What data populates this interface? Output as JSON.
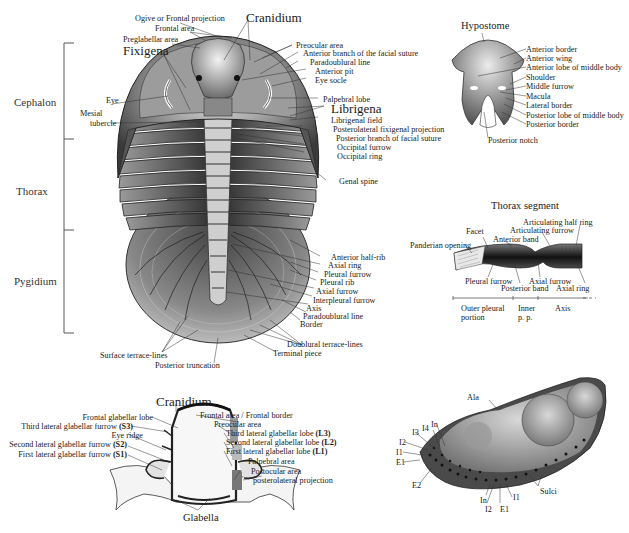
{
  "figure": {
    "main_trilobite": {
      "title": "Cranidium",
      "body_regions": [
        "Cephalon",
        "Thorax",
        "Pygidium"
      ],
      "left_labels": {
        "fixigena": "Fixigena",
        "eye": "Eye",
        "mesial_tubercle_1": "Mesial",
        "mesial_tubercle_2": "tubercle"
      },
      "top_labels": {
        "ogive": "Ogive or Frontal projection",
        "frontal_area": "Frontal area",
        "preglabellar_area": "Preglabellar area"
      },
      "right_labels": [
        "Preocular area",
        "Anterior branch of the facial suture",
        "Paradoublural line",
        "Anterior pit",
        "Eye socle",
        "Palpebral lobe",
        "Librigena",
        "Librigenal field",
        "Posterolateral fixigenal projection",
        "Posterior branch of facial suture",
        "Occipital furrow",
        "Occipital ring",
        "Genal spine"
      ],
      "pygidium_labels": [
        "Anterior half-rib",
        "Axial ring",
        "Pleural furrow",
        "Pleural rib",
        "Axial furrow",
        "Interpleural furrow",
        "Axis",
        "Paradoublural line",
        "Border",
        "Doublural terrace-lines",
        "Terminal piece"
      ],
      "bottom_labels": {
        "surface_terrace": "Surface terrace-lines",
        "posterior_truncation": "Posterior truncation"
      }
    },
    "hypostome": {
      "title": "Hypostome",
      "labels": [
        "Anterior border",
        "Anterior wing",
        "Anterior lobe of middle body",
        "Shoulder",
        "Middle furrow",
        "Macula",
        "Lateral border",
        "Posterior lobe of middle body",
        "Posterior border"
      ],
      "bottom_label": "Posterior notch"
    },
    "thorax_segment": {
      "title": "Thorax segment",
      "labels": {
        "articulating_half_ring": "Articulating half ring",
        "articulating_furrow": "Articulating furrow",
        "facet": "Facet",
        "anterior_band": "Anterior band",
        "panderian_opening": "Panderian opening",
        "pleural_furrow": "Pleural furrow",
        "axial_furrow": "Axial furrow",
        "posterior_band": "Posterior band",
        "axial_ring": "Axial ring"
      },
      "scale": {
        "outer_1": "Outer pleural",
        "outer_2": "portion",
        "inner_1": "Inner",
        "inner_2": "p. p.",
        "axis": "Axis"
      }
    },
    "cranidium_detail": {
      "title": "Cranidium",
      "left_labels": [
        {
          "text": "Frontal glabellar lobe",
          "code": ""
        },
        {
          "text": "Third lateral glabellar furrow ",
          "code": "(S3)"
        },
        {
          "text": "Eye ridge",
          "code": ""
        },
        {
          "text": "Second lateral glabellar furrow ",
          "code": "(S2)"
        },
        {
          "text": "First lateral glabellar furrow ",
          "code": "(S1)"
        }
      ],
      "right_labels": [
        {
          "text": "Frontal area / Frontal border",
          "code": ""
        },
        {
          "text": "Preocular area",
          "code": ""
        },
        {
          "text": "Third lateral glabellar lobe ",
          "code": "(L3)"
        },
        {
          "text": "Second lateral glabellar lobe ",
          "code": "(L2)"
        },
        {
          "text": "First lateral glabellar lobe ",
          "code": "(L1)"
        },
        {
          "text": "Palpebral area",
          "code": ""
        },
        {
          "text": "Postocular area",
          "code": ""
        },
        {
          "text": "posterolateral projection",
          "code": ""
        }
      ],
      "bottom_label": "Glabella"
    },
    "sem_cephalon": {
      "labels": {
        "ala": "Ala",
        "sulci": "Sulci",
        "I4": "I4",
        "In_top": "In",
        "I3": "I3",
        "I2_left": "I2",
        "I1_left": "I1",
        "E1_left": "E1",
        "E2": "E2",
        "In_bottom": "In",
        "I2_bottom": "I2",
        "E1_bottom": "E1",
        "I1_bottom": "I1"
      }
    }
  }
}
